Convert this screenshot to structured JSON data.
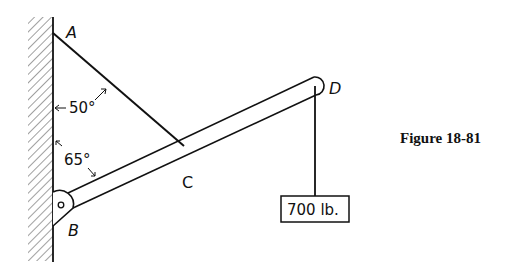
{
  "figure": {
    "caption": "Figure 18-81",
    "points": {
      "A": "A",
      "B": "B",
      "C": "C",
      "D": "D"
    },
    "angles": {
      "cable_to_wall": "50°",
      "boom_to_wall": "65°"
    },
    "load": {
      "label": "700 lb."
    },
    "colors": {
      "ink": "#111111",
      "background": "#ffffff"
    }
  }
}
